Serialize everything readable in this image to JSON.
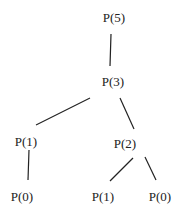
{
  "diagram": {
    "type": "recursion-tree",
    "nodes": [
      {
        "id": "n5",
        "label": "P(5)",
        "x": 114,
        "y": 17
      },
      {
        "id": "n3",
        "label": "P(3)",
        "x": 113,
        "y": 81
      },
      {
        "id": "n1a",
        "label": "P(1)",
        "x": 26,
        "y": 141
      },
      {
        "id": "n2",
        "label": "P(2)",
        "x": 125,
        "y": 143
      },
      {
        "id": "n0a",
        "label": "P(0)",
        "x": 22,
        "y": 196
      },
      {
        "id": "n1b",
        "label": "P(1)",
        "x": 103,
        "y": 196
      },
      {
        "id": "n0b",
        "label": "P(0)",
        "x": 160,
        "y": 196
      }
    ],
    "edges": [
      {
        "from": "n5",
        "to": "n3",
        "x1": 111,
        "y1": 34,
        "x2": 110,
        "y2": 66
      },
      {
        "from": "n3",
        "to": "n1a",
        "x1": 90,
        "y1": 98,
        "x2": 36,
        "y2": 125
      },
      {
        "from": "n3",
        "to": "n2",
        "x1": 120,
        "y1": 98,
        "x2": 134,
        "y2": 129
      },
      {
        "from": "n1a",
        "to": "n0a",
        "x1": 29,
        "y1": 150,
        "x2": 28,
        "y2": 180
      },
      {
        "from": "n2",
        "to": "n1b",
        "x1": 133,
        "y1": 158,
        "x2": 110,
        "y2": 181
      },
      {
        "from": "n2",
        "to": "n0b",
        "x1": 145,
        "y1": 157,
        "x2": 156,
        "y2": 180
      }
    ],
    "colors": {
      "line": "#222222",
      "text": "#222222",
      "background": "#ffffff"
    }
  }
}
